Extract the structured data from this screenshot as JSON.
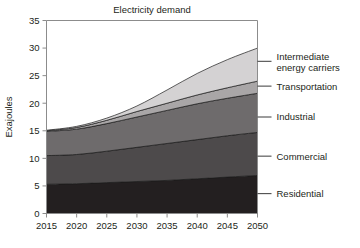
{
  "chart_data": {
    "type": "area",
    "stacked": true,
    "title": "Electricity demand",
    "xlabel": "",
    "ylabel": "Exajoules",
    "xlim": [
      2015,
      2050
    ],
    "ylim": [
      0,
      35
    ],
    "yticks": [
      0,
      5,
      10,
      15,
      20,
      25,
      30,
      35
    ],
    "ytick_labels": [
      "0",
      "5",
      "10",
      "15",
      "20",
      "25",
      "30",
      "35"
    ],
    "xticks": [
      2015,
      2020,
      2025,
      2030,
      2035,
      2040,
      2045,
      2050
    ],
    "xtick_labels": [
      "2015",
      "2020",
      "2025",
      "2030",
      "2035",
      "2040",
      "2045",
      "2050"
    ],
    "grid": false,
    "legend_position": "right-inline-labels",
    "x": [
      2015,
      2020,
      2025,
      2030,
      2035,
      2040,
      2045,
      2050
    ],
    "series": [
      {
        "name": "Residential",
        "color": "#231f20",
        "values": [
          5.3,
          5.4,
          5.6,
          5.8,
          6.0,
          6.3,
          6.6,
          6.9
        ]
      },
      {
        "name": "Commercial",
        "color": "#4d4a4b",
        "values": [
          5.2,
          5.3,
          5.7,
          6.2,
          6.7,
          7.1,
          7.5,
          7.8
        ]
      },
      {
        "name": "Industrial",
        "color": "#6e6b6c",
        "values": [
          4.4,
          4.6,
          5.0,
          5.5,
          6.0,
          6.5,
          6.8,
          7.1
        ]
      },
      {
        "name": "Transportation",
        "color": "#a9a6a7",
        "values": [
          0.1,
          0.3,
          0.6,
          1.0,
          1.3,
          1.6,
          1.9,
          2.2
        ]
      },
      {
        "name": "Intermediate energy carriers",
        "color": "#d4d2d3",
        "values": [
          0.1,
          0.2,
          0.4,
          1.0,
          2.4,
          3.9,
          5.1,
          6.0
        ]
      }
    ],
    "totals": [
      15.1,
      15.8,
      17.3,
      19.5,
      22.4,
      25.4,
      27.9,
      30.0
    ],
    "annotations": [
      {
        "label": "Intermediate energy carriers",
        "lines": [
          "Intermediate",
          "energy carriers"
        ],
        "leader_y_value": 27.6
      },
      {
        "label": "Transportation",
        "lines": [
          "Transportation"
        ],
        "leader_y_value": 23.1
      },
      {
        "label": "Industrial",
        "lines": [
          "Industrial"
        ],
        "leader_y_value": 17.5
      },
      {
        "label": "Commercial",
        "lines": [
          "Commercial"
        ],
        "leader_y_value": 10.4
      },
      {
        "label": "Residential",
        "lines": [
          "Residential"
        ],
        "leader_y_value": 3.6
      }
    ]
  },
  "colors": {
    "background": "#ffffff",
    "axis": "#8c8c8c",
    "text": "#231f20",
    "band_outline": "#1a1a1a"
  }
}
